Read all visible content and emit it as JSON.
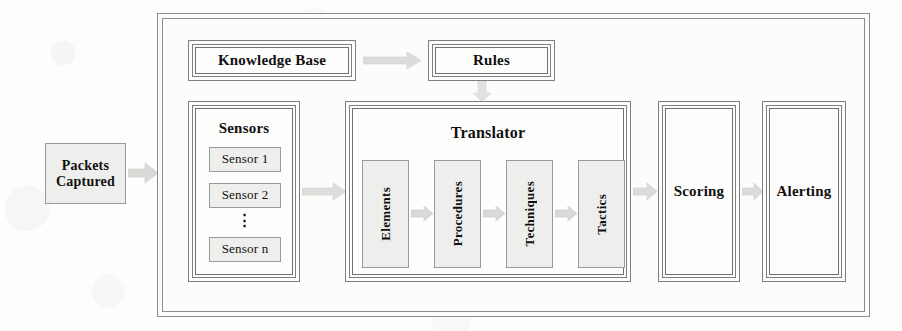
{
  "diagram": {
    "colors": {
      "page_background": "#fdfdfb",
      "box_fill_light": "#eeeeec",
      "box_fill_white": "#fcfcfa",
      "stroke": "#7e7e7e",
      "stroke_dark": "#707070",
      "arrow_fill": "#d8d8d6",
      "text": "#111111"
    },
    "input": {
      "label": "Packets\nCaptured",
      "name": "packets-captured"
    },
    "knowledge_base": {
      "label": "Knowledge Base",
      "name": "knowledge-base"
    },
    "rules": {
      "label": "Rules",
      "name": "rules"
    },
    "sensors": {
      "label": "Sensors",
      "items": [
        {
          "label": "Sensor 1"
        },
        {
          "label": "Sensor 2"
        },
        {
          "label": "Sensor n"
        }
      ],
      "ellipsis": "⋮"
    },
    "translator": {
      "label": "Translator",
      "stages": [
        {
          "label": "Elements"
        },
        {
          "label": "Procedures"
        },
        {
          "label": "Techniques"
        },
        {
          "label": "Tactics"
        }
      ]
    },
    "scoring": {
      "label": "Scoring",
      "name": "scoring"
    },
    "alerting": {
      "label": "Alerting",
      "name": "alerting"
    },
    "arrows": {
      "packets_to_system": "arrow-right",
      "kb_to_rules": "arrow-right",
      "rules_to_translator": "arrow-down",
      "sensors_to_translator": "arrow-right",
      "elements_to_procedures": "arrow-right",
      "procedures_to_techniques": "arrow-right",
      "techniques_to_tactics": "arrow-right",
      "translator_to_scoring": "arrow-right",
      "scoring_to_alerting": "arrow-right"
    }
  }
}
